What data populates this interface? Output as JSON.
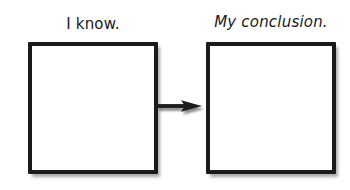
{
  "canvas": {
    "width": 350,
    "height": 190,
    "background_color": "#ffffff"
  },
  "diagram": {
    "type": "two-box-flow",
    "ink_color": "#1b1b1b",
    "boxes": [
      {
        "id": "know",
        "label": "I know.",
        "content": "",
        "x": 28,
        "y": 42,
        "width": 130,
        "height": 132,
        "border_color": "#1b1b1b",
        "fill_color": "#ffffff"
      },
      {
        "id": "conclusion",
        "label": "My conclusion.",
        "content": "",
        "x": 206,
        "y": 42,
        "width": 130,
        "height": 132,
        "border_color": "#1b1b1b",
        "fill_color": "#ffffff"
      }
    ],
    "connector": {
      "id": "arrow-know-to-conclusion",
      "kind": "arrow",
      "direction": "right",
      "from": "know",
      "to": "conclusion",
      "color": "#1b1b1b"
    }
  }
}
